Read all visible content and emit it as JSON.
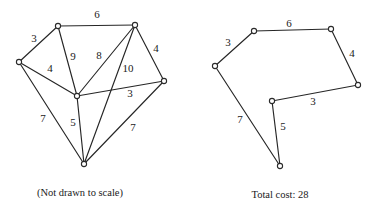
{
  "figure": {
    "kind": "weighted-graph-comparison",
    "stroke_color": "#262626",
    "node_fill": "#ffffff",
    "text_color": "#1a1a1a"
  },
  "left_panel": {
    "caption": "(Not drawn to scale)",
    "caption_pos": {
      "x": 80,
      "y": 193
    },
    "nodes": [
      {
        "id": "A",
        "x": 58,
        "y": 26
      },
      {
        "id": "B",
        "x": 135,
        "y": 25
      },
      {
        "id": "C",
        "x": 19,
        "y": 62
      },
      {
        "id": "D",
        "x": 164,
        "y": 81
      },
      {
        "id": "E",
        "x": 77,
        "y": 96
      },
      {
        "id": "F",
        "x": 84,
        "y": 164
      }
    ],
    "edges": [
      {
        "from": "A",
        "to": "B",
        "weight": "6",
        "lx": 97,
        "ly": 14
      },
      {
        "from": "C",
        "to": "A",
        "weight": "3",
        "lx": 34,
        "ly": 38
      },
      {
        "from": "C",
        "to": "E",
        "weight": "4",
        "lx": 50,
        "ly": 68
      },
      {
        "from": "A",
        "to": "E",
        "weight": "9",
        "lx": 73,
        "ly": 56
      },
      {
        "from": "B",
        "to": "E",
        "weight": "8",
        "lx": 99,
        "ly": 55
      },
      {
        "from": "B",
        "to": "D",
        "weight": "4",
        "lx": 156,
        "ly": 48
      },
      {
        "from": "B",
        "to": "F",
        "weight": "10",
        "lx": 128,
        "ly": 68
      },
      {
        "from": "E",
        "to": "D",
        "weight": "3",
        "lx": 130,
        "ly": 93
      },
      {
        "from": "C",
        "to": "F",
        "weight": "7",
        "lx": 43,
        "ly": 118
      },
      {
        "from": "E",
        "to": "F",
        "weight": "5",
        "lx": 73,
        "ly": 122
      },
      {
        "from": "D",
        "to": "F",
        "weight": "7",
        "lx": 133,
        "ly": 127
      }
    ]
  },
  "right_panel": {
    "caption": "Total cost: 28",
    "caption_pos": {
      "x": 95,
      "y": 195
    },
    "nodes": [
      {
        "id": "A",
        "x": 69,
        "y": 31
      },
      {
        "id": "B",
        "x": 146,
        "y": 29
      },
      {
        "id": "C",
        "x": 30,
        "y": 66
      },
      {
        "id": "D",
        "x": 173,
        "y": 85
      },
      {
        "id": "E",
        "x": 87,
        "y": 101
      },
      {
        "id": "F",
        "x": 95,
        "y": 166
      }
    ],
    "edges": [
      {
        "from": "A",
        "to": "B",
        "weight": "6",
        "lx": 104,
        "ly": 23
      },
      {
        "from": "C",
        "to": "A",
        "weight": "3",
        "lx": 43,
        "ly": 42
      },
      {
        "from": "B",
        "to": "D",
        "weight": "4",
        "lx": 167,
        "ly": 53
      },
      {
        "from": "E",
        "to": "D",
        "weight": "3",
        "lx": 128,
        "ly": 101
      },
      {
        "from": "C",
        "to": "F",
        "weight": "7",
        "lx": 55,
        "ly": 119
      },
      {
        "from": "E",
        "to": "F",
        "weight": "5",
        "lx": 98,
        "ly": 126
      }
    ]
  }
}
